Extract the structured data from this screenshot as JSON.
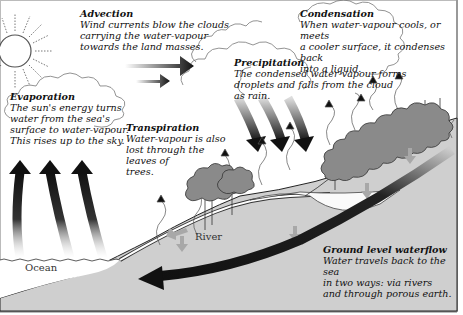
{
  "diagram": {
    "topic": "water cycle",
    "colors": {
      "ground": "#cfcfcf",
      "tree": "#8a8a8a",
      "arrow_dark": "#1a1a1a",
      "arrow_light": "#a8a8a8"
    }
  },
  "labels": {
    "advection": {
      "title": "Advection",
      "lines": [
        "Wind currents blow the clouds",
        "carrying the water-vapour",
        "towards the land masses."
      ]
    },
    "condensation": {
      "title": "Condensation",
      "lines": [
        "When water-vapour cools, or meets",
        "a cooler surface, it condenses back",
        "into a liquid."
      ]
    },
    "precipitation": {
      "title": "Precipitation",
      "lines": [
        "The condensed water-vapour forms",
        "droplets and falls from the cloud",
        "as rain."
      ]
    },
    "evaporation": {
      "title": "Evaporation",
      "lines": [
        "The sun's energy turns",
        "water from the sea's",
        "surface to water-vapour.",
        "This rises up to the sky."
      ]
    },
    "transpiration": {
      "title": "Transpiration",
      "lines": [
        "Water-vapour is also",
        "lost through the",
        "leaves of",
        "trees."
      ]
    },
    "groundflow": {
      "title": "Ground level waterflow",
      "lines": [
        "Water travels back to the sea",
        "in two ways: via rivers",
        "and through porous earth."
      ]
    },
    "river": "River",
    "ocean": "Ocean"
  }
}
